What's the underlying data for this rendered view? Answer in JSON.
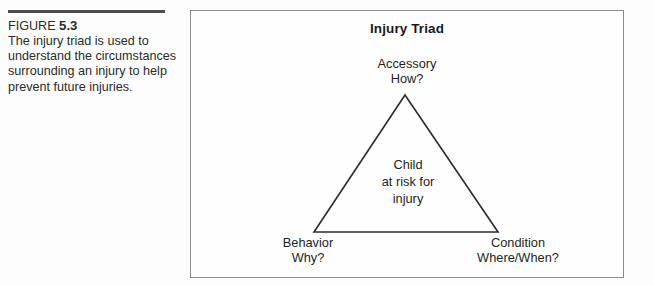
{
  "caption": {
    "figure_label": "FIGURE",
    "figure_number": "5.3",
    "text": "The injury triad is used to understand the circumstances surrounding an injury to help prevent future injuries."
  },
  "diagram": {
    "title": "Injury Triad",
    "center": {
      "line1": "Child",
      "line2": "at risk for",
      "line3": "injury"
    },
    "nodes": {
      "apex": {
        "term": "Accessory",
        "question": "How?"
      },
      "bottom_left": {
        "term": "Behavior",
        "question": "Why?"
      },
      "bottom_right": {
        "term": "Condition",
        "question": "Where/When?"
      }
    },
    "colors": {
      "frame": "#8c8c8c",
      "triangle_stroke": "#2b2b2b",
      "rule": "#4d4d4d",
      "text": "#1f1f1f",
      "background": "#fefefe"
    }
  }
}
